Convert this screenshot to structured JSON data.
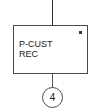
{
  "diagram": {
    "type": "flowchart-block",
    "background_color": "#ffffff",
    "line_color": "#4a4a4a",
    "text_color": "#1a1a1a",
    "process": {
      "label_line1": "P-CUST",
      "label_line2": "REC",
      "marker_icon": "square-dot-marker"
    },
    "connectors": {
      "top_line": "",
      "bottom_line": "",
      "circle_label": "4"
    }
  }
}
